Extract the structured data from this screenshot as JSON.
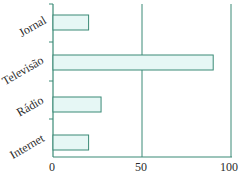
{
  "chart_data": {
    "type": "bar",
    "orientation": "horizontal",
    "title": "",
    "xlabel": "",
    "ylabel": "",
    "categories": [
      "Jornal",
      "Televisão",
      "Rádio",
      "Internet"
    ],
    "values": [
      20,
      90,
      27,
      20
    ],
    "xlim": [
      0,
      100
    ],
    "xticks": [
      "0",
      "50",
      "100"
    ],
    "grid": "vertical lines at 50 and 100",
    "legend": "none"
  },
  "colors": {
    "bar_fill": "#e6f7f5",
    "bar_stroke": "#3a8a76",
    "axis": "#3a8a76"
  }
}
